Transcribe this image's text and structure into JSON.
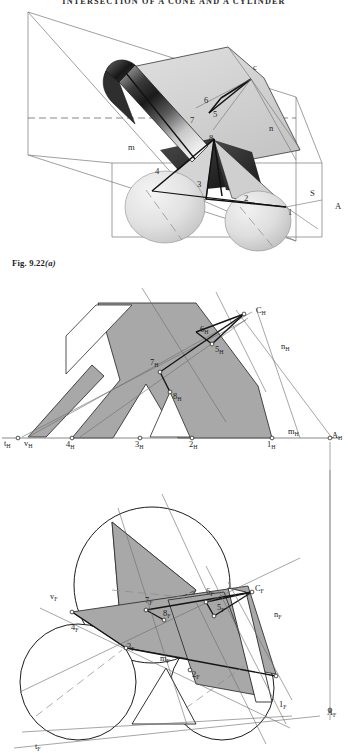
{
  "page": {
    "running_head": "INTERSECTION OF A CONE AND A CYLINDER",
    "caption_prefix": "Fig. 9.22",
    "caption_suffix": "(a)"
  },
  "colors": {
    "fill_gray": "#a8a8a8",
    "line_dark": "#1c1c1c",
    "line_thin": "#6e6e6e",
    "cylinder_dark": "#2a2a2a",
    "cone_light": "#e3e3e3",
    "paper": "#ffffff"
  },
  "pictorial_view": {
    "name": "pictorial-3d-view",
    "labels": [
      {
        "text": "c",
        "x": 253,
        "y": 70
      },
      {
        "text": "6",
        "x": 204,
        "y": 103
      },
      {
        "text": "5",
        "x": 213,
        "y": 117
      },
      {
        "text": "7",
        "x": 190,
        "y": 123
      },
      {
        "text": "8",
        "x": 209,
        "y": 141
      },
      {
        "text": "n",
        "x": 269,
        "y": 131
      },
      {
        "text": "m",
        "x": 128,
        "y": 150
      },
      {
        "text": "4",
        "x": 155,
        "y": 174
      },
      {
        "text": "3",
        "x": 197,
        "y": 187
      },
      {
        "text": "2",
        "x": 244,
        "y": 201
      },
      {
        "text": "1",
        "x": 288,
        "y": 215
      },
      {
        "text": "S",
        "x": 310,
        "y": 196
      },
      {
        "text": "A",
        "x": 335,
        "y": 209
      }
    ]
  },
  "horizontal_view": {
    "name": "horizontal-projection-view",
    "labels": [
      {
        "base": "t",
        "sub": "H",
        "x": 4,
        "y": 446
      },
      {
        "base": "v",
        "sub": "H",
        "x": 24,
        "y": 446
      },
      {
        "base": "4",
        "sub": "H",
        "x": 66,
        "y": 447
      },
      {
        "base": "3",
        "sub": "H",
        "x": 135,
        "y": 447
      },
      {
        "base": "2",
        "sub": "H",
        "x": 189,
        "y": 447
      },
      {
        "base": "1",
        "sub": "H",
        "x": 267,
        "y": 447
      },
      {
        "base": "m",
        "sub": "H",
        "x": 288,
        "y": 434
      },
      {
        "base": "A",
        "sub": "H",
        "x": 332,
        "y": 438
      },
      {
        "base": "C",
        "sub": "H",
        "x": 256,
        "y": 313
      },
      {
        "base": "6",
        "sub": "H",
        "x": 200,
        "y": 332
      },
      {
        "base": "5",
        "sub": "H",
        "x": 215,
        "y": 352
      },
      {
        "base": "7",
        "sub": "H",
        "x": 150,
        "y": 365
      },
      {
        "base": "8",
        "sub": "H",
        "x": 173,
        "y": 399
      },
      {
        "base": "n",
        "sub": "H",
        "x": 281,
        "y": 349
      }
    ]
  },
  "frontal_view": {
    "name": "frontal-projection-view",
    "labels": [
      {
        "base": "v",
        "sub": "F",
        "x": 50,
        "y": 599
      },
      {
        "base": "7",
        "sub": "F",
        "x": 145,
        "y": 603
      },
      {
        "base": "6",
        "sub": "F",
        "x": 206,
        "y": 594
      },
      {
        "base": "C",
        "sub": "F",
        "x": 255,
        "y": 591
      },
      {
        "base": "5",
        "sub": "F",
        "x": 217,
        "y": 610
      },
      {
        "base": "4",
        "sub": "F",
        "x": 71,
        "y": 630
      },
      {
        "base": "8",
        "sub": "F",
        "x": 163,
        "y": 616
      },
      {
        "base": "3",
        "sub": "F",
        "x": 127,
        "y": 649
      },
      {
        "base": "m",
        "sub": "F",
        "x": 160,
        "y": 661
      },
      {
        "base": "n",
        "sub": "F",
        "x": 274,
        "y": 617
      },
      {
        "base": "2",
        "sub": "F",
        "x": 192,
        "y": 677
      },
      {
        "base": "1",
        "sub": "F",
        "x": 279,
        "y": 707
      },
      {
        "base": "A",
        "sub": "F",
        "x": 327,
        "y": 715
      },
      {
        "base": "t",
        "sub": "F",
        "x": 35,
        "y": 749
      }
    ]
  }
}
